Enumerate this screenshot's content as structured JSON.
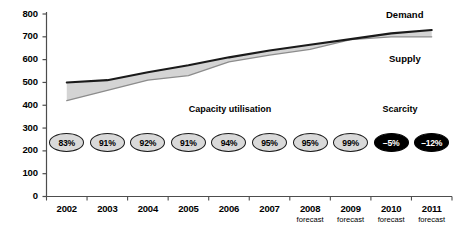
{
  "chart_data": {
    "type": "line",
    "title": "",
    "xlabel": "",
    "ylabel": "",
    "ylim": [
      0,
      800
    ],
    "ytick_step": 100,
    "grid": false,
    "legend_position": "inline-right",
    "categories": [
      "2002",
      "2003",
      "2004",
      "2005",
      "2006",
      "2007",
      "2008",
      "2009",
      "2010",
      "2011"
    ],
    "category_sublabels": [
      "",
      "",
      "",
      "",
      "",
      "",
      "forecast",
      "forecast",
      "forecast",
      "forecast"
    ],
    "ytick_labels": [
      "0",
      "100",
      "200",
      "300",
      "400",
      "500",
      "600",
      "700",
      "800"
    ],
    "series": [
      {
        "name": "Demand",
        "color": "#1a1a1a",
        "values": [
          500,
          510,
          545,
          575,
          610,
          640,
          665,
          690,
          715,
          730
        ]
      },
      {
        "name": "Supply",
        "color": "#8c8c8c",
        "values": [
          420,
          465,
          510,
          530,
          590,
          620,
          645,
          688,
          700,
          700
        ]
      }
    ],
    "shaded_gap": {
      "label": "scarcity-gap",
      "fill": "#d4d4d4",
      "from_category": "2009",
      "to_category": "2011"
    },
    "annotations": [
      {
        "name": "capacity-utilisation",
        "text": "Capacity utilisation"
      },
      {
        "name": "scarcity",
        "text": "Scarcity"
      }
    ],
    "data_labels": {
      "name": "capacity-utilisation-pills",
      "values": [
        "83%",
        "91%",
        "92%",
        "91%",
        "94%",
        "95%",
        "95%",
        "99%",
        "–5%",
        "–12%"
      ],
      "styles": [
        "light",
        "light",
        "light",
        "light",
        "light",
        "light",
        "light",
        "light",
        "dark",
        "dark"
      ]
    }
  },
  "colors": {
    "demand_line": "#1a1a1a",
    "supply_line": "#8c8c8c",
    "gap_fill": "#d4d4d4",
    "axis": "#4d4d4d",
    "pill_light_fill": "#d9d9d9",
    "pill_dark_fill": "#000000",
    "background": "#ffffff"
  }
}
